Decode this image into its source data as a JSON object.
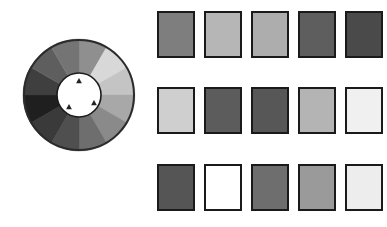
{
  "figure": {
    "background_color": "#ffffff"
  },
  "color_wheel": {
    "name": "grayscale-color-wheel",
    "center_x": 58,
    "center_y": 58,
    "outer_radius": 56,
    "inner_radius": 22,
    "ring_border_color": "#2b2b2b",
    "ring_border_width": 2,
    "hub_color": "#ffffff",
    "hub_border_color": "#1c1c1c",
    "segment_count": 12,
    "segments": [
      {
        "index": 0,
        "start_angle": -90,
        "end_angle": -60,
        "color": "#8f8f8f",
        "label": "segment-1"
      },
      {
        "index": 1,
        "start_angle": -60,
        "end_angle": -30,
        "color": "#d8d8d8",
        "label": "segment-2"
      },
      {
        "index": 2,
        "start_angle": -30,
        "end_angle": 0,
        "color": "#c4c4c4",
        "label": "segment-3"
      },
      {
        "index": 3,
        "start_angle": 0,
        "end_angle": 30,
        "color": "#a8a8a8",
        "label": "segment-4"
      },
      {
        "index": 4,
        "start_angle": 30,
        "end_angle": 60,
        "color": "#8a8a8a",
        "label": "segment-5"
      },
      {
        "index": 5,
        "start_angle": 60,
        "end_angle": 90,
        "color": "#6e6e6e",
        "label": "segment-6"
      },
      {
        "index": 6,
        "start_angle": 90,
        "end_angle": 120,
        "color": "#4f4f4f",
        "label": "segment-7"
      },
      {
        "index": 7,
        "start_angle": 120,
        "end_angle": 150,
        "color": "#3a3a3a",
        "label": "segment-8"
      },
      {
        "index": 8,
        "start_angle": 150,
        "end_angle": 180,
        "color": "#1f1f1f",
        "label": "segment-9"
      },
      {
        "index": 9,
        "start_angle": 180,
        "end_angle": 210,
        "color": "#3f3f3f",
        "label": "segment-10"
      },
      {
        "index": 10,
        "start_angle": 210,
        "end_angle": 240,
        "color": "#5e5e5e",
        "label": "segment-11"
      },
      {
        "index": 11,
        "start_angle": 240,
        "end_angle": 270,
        "color": "#747474",
        "label": "segment-12"
      }
    ],
    "markers": [
      {
        "name": "marker-top",
        "x": 58,
        "y": 44,
        "rotation": 0,
        "color": "#232323",
        "size": 5
      },
      {
        "name": "marker-lower-left",
        "x": 48,
        "y": 70,
        "rotation": 0,
        "color": "#232323",
        "size": 5
      },
      {
        "name": "marker-right",
        "x": 73,
        "y": 66,
        "rotation": 0,
        "color": "#232323",
        "size": 5
      }
    ]
  },
  "swatch_grid": {
    "name": "grayscale-swatch-grid",
    "rows": 3,
    "columns": 5,
    "swatch_border_color": "#1a1a1a",
    "rows_data": [
      {
        "row_index": 0,
        "name": "swatch-row-1",
        "swatches": [
          {
            "index": 0,
            "color": "#7e7e7e"
          },
          {
            "index": 1,
            "color": "#b6b6b6"
          },
          {
            "index": 2,
            "color": "#adadad"
          },
          {
            "index": 3,
            "color": "#5e5e5e"
          },
          {
            "index": 4,
            "color": "#4a4a4a"
          }
        ]
      },
      {
        "row_index": 1,
        "name": "swatch-row-2",
        "swatches": [
          {
            "index": 0,
            "color": "#cfcfcf"
          },
          {
            "index": 1,
            "color": "#5c5c5c"
          },
          {
            "index": 2,
            "color": "#575757"
          },
          {
            "index": 3,
            "color": "#b4b4b4"
          },
          {
            "index": 4,
            "color": "#f0f0f0"
          }
        ]
      },
      {
        "row_index": 2,
        "name": "swatch-row-3",
        "swatches": [
          {
            "index": 0,
            "color": "#555555"
          },
          {
            "index": 1,
            "color": "#ffffff"
          },
          {
            "index": 2,
            "color": "#6e6e6e"
          },
          {
            "index": 3,
            "color": "#9a9a9a"
          },
          {
            "index": 4,
            "color": "#ededed"
          }
        ]
      }
    ]
  }
}
